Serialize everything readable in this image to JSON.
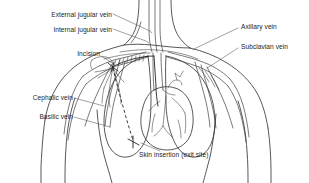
{
  "figure": {
    "style": {
      "background": "#ffffff",
      "line_color": "#3a3a3a",
      "label_color": "#1d1d1d",
      "catheter_color": "#222222"
    }
  },
  "labels": [
    {
      "id": "external-jugular-vein",
      "text": "External jugular vein",
      "align": "right",
      "x": 18,
      "y": 12,
      "width": 94
    },
    {
      "id": "internal-jugular-vein",
      "text": "Internal jugular vein",
      "align": "right",
      "x": 18,
      "y": 27,
      "width": 94
    },
    {
      "id": "incision",
      "text": "Incision",
      "align": "right",
      "x": 44,
      "y": 54,
      "width": 56
    },
    {
      "id": "cephalic-vein",
      "text": "Cephalic vein",
      "align": "right",
      "x": 5,
      "y": 96,
      "width": 68
    },
    {
      "id": "basilic-vein",
      "text": "Basilic vein",
      "align": "right",
      "x": 5,
      "y": 115,
      "width": 68
    },
    {
      "id": "axillary-vein",
      "text": "Axillary vein",
      "align": "left",
      "x": 240,
      "y": 26,
      "width": 66
    },
    {
      "id": "subclavian-vein",
      "text": "Subclavian vein",
      "align": "left",
      "x": 240,
      "y": 46,
      "width": 66
    },
    {
      "id": "skin-insertion-exit-site",
      "text": "Skin insertion (exit site)",
      "align": "left",
      "x": 138,
      "y": 153,
      "width": 110
    }
  ],
  "anatomy_parts": [
    "neck",
    "left-shoulder",
    "right-shoulder",
    "left-arm",
    "right-arm",
    "thorax",
    "left-lung",
    "right-lung",
    "heart",
    "superior-vena-cava",
    "clavicle"
  ],
  "catheter": {
    "tunnel_style": "dashed",
    "exit_marker": "x-cross",
    "entry_label": "incision",
    "exit_label": "skin insertion (exit site)"
  }
}
